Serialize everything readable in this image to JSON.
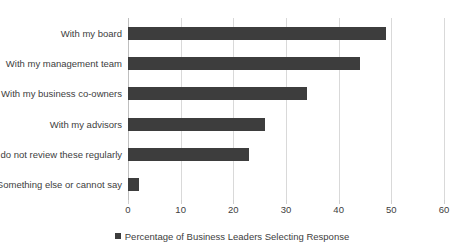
{
  "chart_data": {
    "type": "bar",
    "orientation": "horizontal",
    "title": "",
    "subtitle": "",
    "xlabel": "",
    "ylabel": "",
    "xlim": [
      0,
      60
    ],
    "xticks": [
      "0",
      "10",
      "20",
      "30",
      "40",
      "50",
      "60"
    ],
    "xtick_values": [
      0,
      10,
      20,
      30,
      40,
      50,
      60
    ],
    "grid": "vertical",
    "legend_position": "bottom",
    "categories": [
      "With my board",
      "With my management team",
      "With my business co-owners",
      "With my advisors",
      "I do not review these regularly",
      "Something else or cannot say"
    ],
    "series": [
      {
        "name": "Percentage of Business Leaders Selecting Response",
        "color": "#3d3d3d",
        "values": [
          49,
          44,
          34,
          26,
          23,
          2
        ]
      }
    ]
  },
  "legend": {
    "marker_name": "legend-color-swatch",
    "label": "Percentage of Business Leaders Selecting Response",
    "color": "#3d3d3d"
  },
  "colors": {
    "bar": "#3d3d3d",
    "gridline": "#d9d9d9",
    "axis": "#bfbfbf",
    "text": "#404040",
    "background": "#ffffff"
  }
}
